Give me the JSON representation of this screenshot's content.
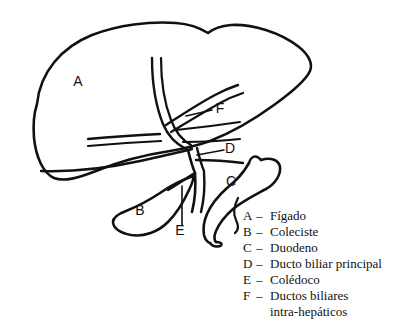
{
  "figure": {
    "background_color": "#ffffff",
    "ink_color": "#111111",
    "diagram_labels": [
      {
        "key": "A",
        "name": "liver-label",
        "x": 78,
        "y": 86
      },
      {
        "key": "B",
        "name": "gallbladder-label",
        "x": 140,
        "y": 215
      },
      {
        "key": "C",
        "name": "duodenum-label",
        "x": 231,
        "y": 186
      },
      {
        "key": "D",
        "name": "main-bile-duct-label",
        "x": 230,
        "y": 153
      },
      {
        "key": "E",
        "name": "common-bile-duct-label",
        "x": 180,
        "y": 235
      },
      {
        "key": "F",
        "name": "intrahepatic-ducts-label",
        "x": 220,
        "y": 113
      }
    ]
  },
  "legend": {
    "name": "legend-key-list",
    "separator": "–",
    "items": [
      {
        "key": "A",
        "text": "Fígado",
        "continuation": null
      },
      {
        "key": "B",
        "text": "Coleciste",
        "continuation": null
      },
      {
        "key": "C",
        "text": "Duodeno",
        "continuation": null
      },
      {
        "key": "D",
        "text": "Ducto biliar principal",
        "continuation": null
      },
      {
        "key": "E",
        "text": "Colédoco",
        "continuation": null
      },
      {
        "key": "F",
        "text": "Ductos biliares",
        "continuation": "intra-hepáticos"
      }
    ]
  }
}
